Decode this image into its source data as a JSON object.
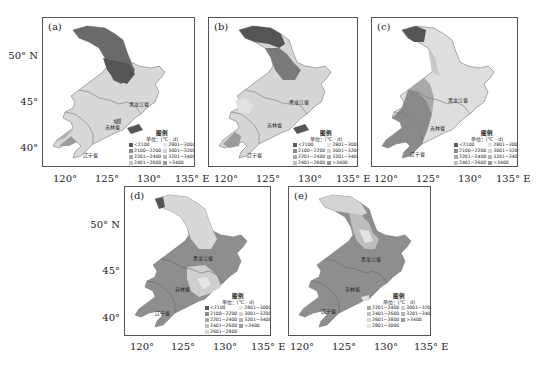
{
  "figure": {
    "legend_title": "图例",
    "legend_unit": "单位：(℃ · d)",
    "x_ticks": [
      "120°",
      "125°",
      "130°",
      "135° E"
    ],
    "y_ticks": [
      "50° N",
      "45°",
      "40°"
    ],
    "provinces": {
      "heilongjiang": "黑龙江省",
      "jilin": "吉林省",
      "liaoning": "辽宁省"
    },
    "colors": {
      "lt2100": "#5a5a5a",
      "2100_2200": "#8a8a8a",
      "2201_2400": "#a8a8a8",
      "2401_2600": "#c2c2c2",
      "2601_2800": "#d6d6d6",
      "2801_3000": "#e4e4e4",
      "3001_3200": "#d0d0d0",
      "3201_3400": "#b4b4b4",
      "gt3400": "#9a9a9a"
    }
  },
  "panels": [
    {
      "id": "a",
      "label": "(a)",
      "legend": [
        {
          "range": "<2100",
          "color": "#5a5a5a"
        },
        {
          "range": "2801~3000",
          "color": "#e4e4e4"
        },
        {
          "range": "2100~2200",
          "color": "#8a8a8a"
        },
        {
          "range": "3001~3200",
          "color": "#d0d0d0"
        },
        {
          "range": "2201~2400",
          "color": "#a8a8a8"
        },
        {
          "range": "3201~3400",
          "color": "#b4b4b4"
        },
        {
          "range": "2401~2600",
          "color": "#c2c2c2"
        },
        {
          "range": ">3400",
          "color": "#9a9a9a"
        },
        {
          "range": "2601~2800",
          "color": "#d6d6d6"
        }
      ]
    },
    {
      "id": "b",
      "label": "(b)",
      "legend": [
        {
          "range": "<2100",
          "color": "#5a5a5a"
        },
        {
          "range": "2801~3000",
          "color": "#e4e4e4"
        },
        {
          "range": "2100~2200",
          "color": "#8a8a8a"
        },
        {
          "range": "3001~3200",
          "color": "#d0d0d0"
        },
        {
          "range": "2201~2400",
          "color": "#a8a8a8"
        },
        {
          "range": "3201~3400",
          "color": "#b4b4b4"
        },
        {
          "range": "2401~2600",
          "color": "#c2c2c2"
        },
        {
          "range": ">3400",
          "color": "#9a9a9a"
        },
        {
          "range": "2601~2800",
          "color": "#d6d6d6"
        }
      ]
    },
    {
      "id": "c",
      "label": "(c)",
      "legend": [
        {
          "range": "<2100",
          "color": "#5a5a5a"
        },
        {
          "range": "2801~3000",
          "color": "#e4e4e4"
        },
        {
          "range": "2100~2200",
          "color": "#8a8a8a"
        },
        {
          "range": "3001~3200",
          "color": "#d0d0d0"
        },
        {
          "range": "2201~2400",
          "color": "#a8a8a8"
        },
        {
          "range": "3201~3400",
          "color": "#b4b4b4"
        },
        {
          "range": "2401~2600",
          "color": "#c2c2c2"
        },
        {
          "range": ">3400",
          "color": "#9a9a9a"
        },
        {
          "range": "2601~2800",
          "color": "#d6d6d6"
        }
      ]
    },
    {
      "id": "d",
      "label": "(d)",
      "legend": [
        {
          "range": "<2100",
          "color": "#5a5a5a"
        },
        {
          "range": "2801~3000",
          "color": "#e4e4e4"
        },
        {
          "range": "2100~2200",
          "color": "#8a8a8a"
        },
        {
          "range": "3001~3200",
          "color": "#d0d0d0"
        },
        {
          "range": "2201~2400",
          "color": "#a8a8a8"
        },
        {
          "range": "3201~3400",
          "color": "#b4b4b4"
        },
        {
          "range": "2401~2600",
          "color": "#c2c2c2"
        },
        {
          "range": ">3400",
          "color": "#9a9a9a"
        },
        {
          "range": "2601~2800",
          "color": "#d6d6d6"
        }
      ]
    },
    {
      "id": "e",
      "label": "(e)",
      "legend": [
        {
          "range": "2201~2400",
          "color": "#a8a8a8"
        },
        {
          "range": "3001~3200",
          "color": "#d0d0d0"
        },
        {
          "range": "2401~2600",
          "color": "#c2c2c2"
        },
        {
          "range": "3201~3400",
          "color": "#b4b4b4"
        },
        {
          "range": "2601~2800",
          "color": "#d6d6d6"
        },
        {
          "range": ">3400",
          "color": "#9a9a9a"
        },
        {
          "range": "2801~3000",
          "color": "#e4e4e4"
        }
      ]
    }
  ]
}
